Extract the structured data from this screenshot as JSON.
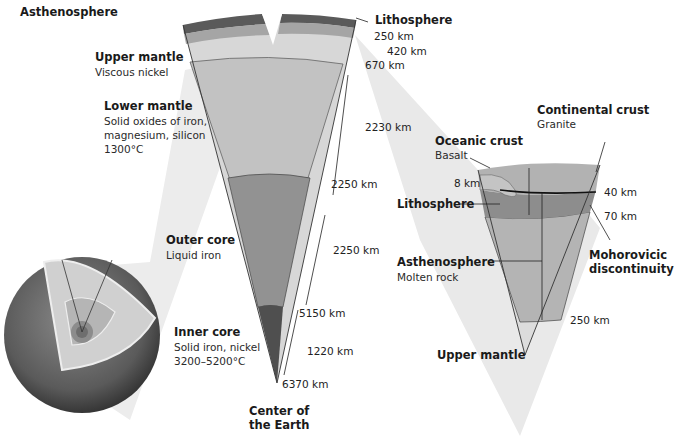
{
  "diagram": {
    "colors": {
      "crust": "#b8b8b8",
      "lithosphere": "#5a5a5a",
      "asthenosphere": "#9a9a9a",
      "upper_mantle": "#d6d6d6",
      "lower_mantle": "#bdbdbd",
      "outer_core": "#8f8f8f",
      "inner_core": "#505050",
      "projection": "#e8e8e8"
    },
    "main_wedge": {
      "layers": [
        {
          "name": "Asthenosphere"
        },
        {
          "name": "Upper mantle",
          "desc": "Viscous nickel"
        },
        {
          "name": "Lower mantle",
          "desc_lines": [
            "Solid oxides of iron,",
            "magnesium, silicon",
            "1300°C"
          ]
        },
        {
          "name": "Outer core",
          "desc": "Liquid iron"
        },
        {
          "name": "Inner core",
          "desc_lines": [
            "Solid iron, nickel",
            "3200–5200°C"
          ]
        }
      ],
      "lithosphere_label": "Lithosphere",
      "depths": [
        "250 km",
        "420 km",
        "670 km",
        "2230 km",
        "2250 km",
        "2250 km",
        "5150 km",
        "1220 km",
        "6370 km"
      ],
      "center_label_lines": [
        "Center of",
        "the Earth"
      ]
    },
    "detail_wedge": {
      "continental_crust": {
        "name": "Continental crust",
        "desc": "Granite"
      },
      "oceanic_crust": {
        "name": "Oceanic crust",
        "desc": "Basalt"
      },
      "lithosphere": "Lithosphere",
      "asthenosphere": {
        "name": "Asthenosphere",
        "desc": "Molten rock"
      },
      "moho_lines": [
        "Mohorovicic",
        "discontinuity"
      ],
      "upper_mantle": "Upper mantle",
      "depths": [
        "8 km",
        "40 km",
        "70 km",
        "250 km"
      ]
    }
  }
}
